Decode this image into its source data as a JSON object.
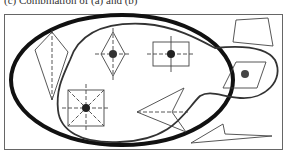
{
  "caption": "(c) Combination of (a) and (b)",
  "colors": {
    "frame": "#555555",
    "thick_region": "#111111",
    "thin_region": "#333333",
    "shape_stroke": "#444444",
    "center_dot": "#333333"
  },
  "regions": [
    {
      "name": "thick-ellipse-region",
      "style": "thick"
    },
    {
      "name": "thin-blob-region",
      "style": "thin"
    }
  ],
  "shapes": [
    {
      "name": "kite-with-axis",
      "center_dot": false,
      "inside": [
        "thick-ellipse-region"
      ]
    },
    {
      "name": "rhombus-with-cross-and-dot",
      "center_dot": true,
      "inside": [
        "thick-ellipse-region",
        "thin-blob-region"
      ]
    },
    {
      "name": "rectangle-with-cross-and-dot",
      "center_dot": true,
      "inside": [
        "thick-ellipse-region",
        "thin-blob-region"
      ]
    },
    {
      "name": "square-with-star-axes-and-dot",
      "center_dot": true,
      "inside": [
        "thick-ellipse-region",
        "thin-blob-region"
      ]
    },
    {
      "name": "arrowhead-with-axis",
      "center_dot": false,
      "inside": [
        "thick-ellipse-region",
        "thin-blob-region"
      ]
    },
    {
      "name": "parallelogram-with-dot",
      "center_dot": true,
      "inside": [
        "thin-blob-region"
      ]
    },
    {
      "name": "quadrilateral",
      "center_dot": false,
      "inside": []
    },
    {
      "name": "long-arrowhead",
      "center_dot": false,
      "inside": []
    }
  ]
}
